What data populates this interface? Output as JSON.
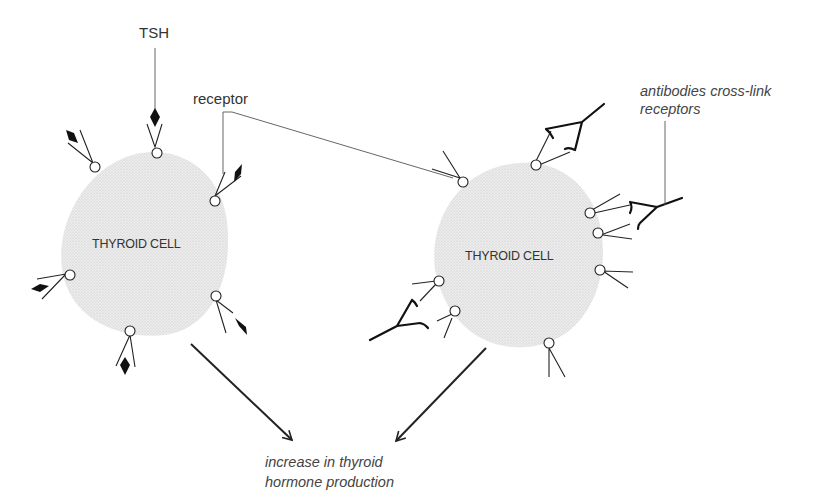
{
  "figure": {
    "labels": {
      "tsh": "TSH",
      "receptor": "receptor",
      "antibodies_line1": "antibodies cross-link",
      "antibodies_line2": "receptors",
      "outcome_line1": "increase in thyroid",
      "outcome_line2": "hormone production"
    },
    "left_cell": {
      "label": "THYROID CELL",
      "description": "normal: TSH binds receptors"
    },
    "right_cell": {
      "label": "THYROID CELL",
      "description": "antibodies cross-link receptors"
    },
    "colors": {
      "cell_fill": "#e4e4e4",
      "ink": "#222222",
      "background": "#ffffff"
    }
  }
}
